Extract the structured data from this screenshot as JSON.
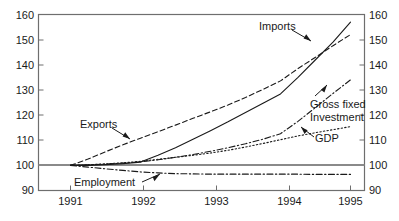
{
  "chart_data": {
    "type": "line",
    "title": "",
    "subtitle": "",
    "xlabel": "",
    "ylabel": "",
    "xlim": [
      1991,
      1995
    ],
    "ylim": [
      90,
      160
    ],
    "grid": false,
    "legend_position": "inline-annotations",
    "reference_line": 100,
    "index_base": "1991 = 100",
    "x_ticks": [
      "1991",
      "1992",
      "1993",
      "1994",
      "1995"
    ],
    "x_tick_values": [
      1991,
      1992,
      1993,
      1994,
      1995
    ],
    "y_ticks_left": [
      "160",
      "150",
      "140",
      "130",
      "120",
      "110",
      "100",
      "90"
    ],
    "y_ticks_right": [
      "160",
      "150",
      "140",
      "130",
      "120",
      "110",
      "100",
      "90"
    ],
    "y_tick_values": [
      160,
      150,
      140,
      130,
      120,
      110,
      100,
      90
    ],
    "x": [
      1991.0,
      1991.25,
      1991.5,
      1991.75,
      1992.0,
      1992.25,
      1992.5,
      1992.75,
      1993.0,
      1993.25,
      1993.5,
      1993.75,
      1994.0,
      1994.25,
      1994.5,
      1994.75,
      1995.0
    ],
    "series": [
      {
        "name": "Imports",
        "style": "solid",
        "values": [
          100.0,
          100.0,
          100.3,
          100.7,
          101.3,
          104.0,
          107.0,
          110.4,
          113.8,
          117.3,
          121.0,
          124.7,
          128.4,
          135.0,
          142.0,
          149.0,
          157.0
        ],
        "end_value": 157.0
      },
      {
        "name": "Exports",
        "style": "dashed",
        "values": [
          100.0,
          102.5,
          105.4,
          108.2,
          110.8,
          113.4,
          116.0,
          118.7,
          121.3,
          124.0,
          127.0,
          130.2,
          133.6,
          138.5,
          143.0,
          147.6,
          152.0
        ],
        "end_value": 152.0
      },
      {
        "name": "Gross fixed Investment",
        "style": "dashdot",
        "values": [
          100.0,
          100.2,
          100.5,
          100.9,
          101.4,
          102.2,
          103.2,
          104.3,
          105.6,
          107.0,
          108.6,
          110.4,
          112.6,
          117.5,
          123.0,
          128.6,
          134.0
        ],
        "end_value": 134.0
      },
      {
        "name": "GDP",
        "style": "dotted",
        "values": [
          100.0,
          100.2,
          100.6,
          101.0,
          101.6,
          102.4,
          103.2,
          104.0,
          104.9,
          106.0,
          107.3,
          108.7,
          110.2,
          111.7,
          113.0,
          114.2,
          115.4
        ],
        "end_value": 115.4
      },
      {
        "name": "Employment",
        "style": "dashdot",
        "values": [
          100.0,
          99.3,
          98.6,
          98.0,
          97.4,
          97.0,
          96.7,
          96.6,
          96.5,
          96.5,
          96.5,
          96.5,
          96.5,
          96.5,
          96.4,
          96.4,
          96.4
        ],
        "end_value": 96.4
      }
    ],
    "annotations": [
      {
        "text": "Imports",
        "series": "Imports"
      },
      {
        "text": "Exports",
        "series": "Exports"
      },
      {
        "text": "Gross fixed",
        "series": "Gross fixed Investment"
      },
      {
        "text": "Investment",
        "series": "Gross fixed Investment"
      },
      {
        "text": "GDP",
        "series": "GDP"
      },
      {
        "text": "Employment",
        "series": "Employment"
      }
    ]
  },
  "axes": {
    "left_ticks": [
      "160",
      "150",
      "140",
      "130",
      "120",
      "110",
      "100",
      "90"
    ],
    "right_ticks": [
      "160",
      "150",
      "140",
      "130",
      "120",
      "110",
      "100",
      "90"
    ],
    "x_ticks": [
      "1991",
      "1992",
      "1993",
      "1994",
      "1995"
    ]
  },
  "labels": {
    "imports": "Imports",
    "exports": "Exports",
    "gross_fixed_line1": "Gross fixed",
    "gross_fixed_line2": "Investment",
    "gdp": "GDP",
    "employment": "Employment"
  },
  "colors": {
    "background": "#ffffff",
    "ink": "#1a1a1a",
    "frame": "#6e6e6e",
    "reference": "#8a8a8a"
  }
}
